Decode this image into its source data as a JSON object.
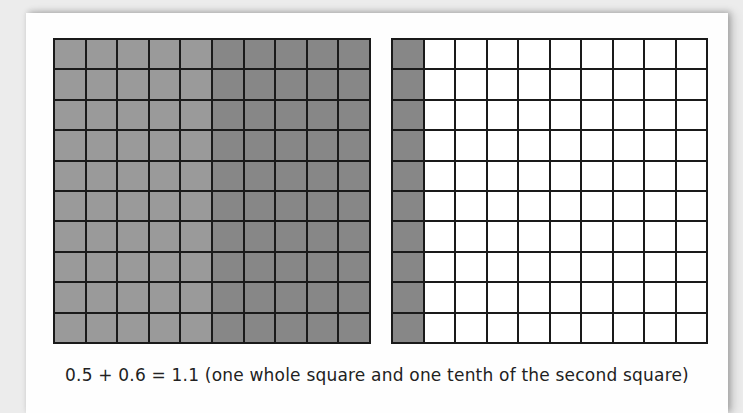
{
  "figure": {
    "caption": "0.5 + 0.6 = 1.1 (one whole square and one tenth of the second square)",
    "colors": {
      "background": "#ececec",
      "panel": "#fefefe",
      "grid_line": "#1a1a1a",
      "shade_light": "#9a9a9a",
      "shade_dark": "#878787",
      "unshaded": "#ffffff"
    },
    "grids": [
      {
        "name": "first-square",
        "rows": 10,
        "cols": 10,
        "shaded_light_columns": 5,
        "shaded_dark_columns": 5,
        "total_shaded": 100,
        "represents": "1.0 (0.5 + 0.5 of 0.6)"
      },
      {
        "name": "second-square",
        "rows": 10,
        "cols": 10,
        "shaded_dark_columns": 1,
        "total_shaded": 10,
        "represents": "0.1"
      }
    ]
  }
}
